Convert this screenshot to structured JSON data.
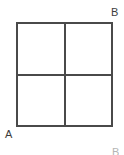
{
  "figure": {
    "background_color": "#ffffff",
    "line_color": "#4a4a4a",
    "fill_color": "#ffffff",
    "label_color": "#3d3d3d"
  },
  "labels": {
    "top_right": "B",
    "bottom_left": "A",
    "edge_fragment": "B"
  },
  "geometry": {
    "shape": "square",
    "subdivisions": 4,
    "divider_vertical": "midline-vertical",
    "divider_horizontal": "midline-horizontal"
  }
}
